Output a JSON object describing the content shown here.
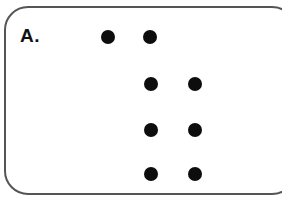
{
  "panel": {
    "label": "A.",
    "border_color": "#555555",
    "dot_color": "#0d0d0d"
  },
  "dots": [
    {
      "x": 108,
      "y": 37
    },
    {
      "x": 150,
      "y": 37
    },
    {
      "x": 151,
      "y": 84
    },
    {
      "x": 195,
      "y": 84
    },
    {
      "x": 151,
      "y": 130
    },
    {
      "x": 195,
      "y": 130
    },
    {
      "x": 151,
      "y": 174
    },
    {
      "x": 195,
      "y": 174
    }
  ]
}
